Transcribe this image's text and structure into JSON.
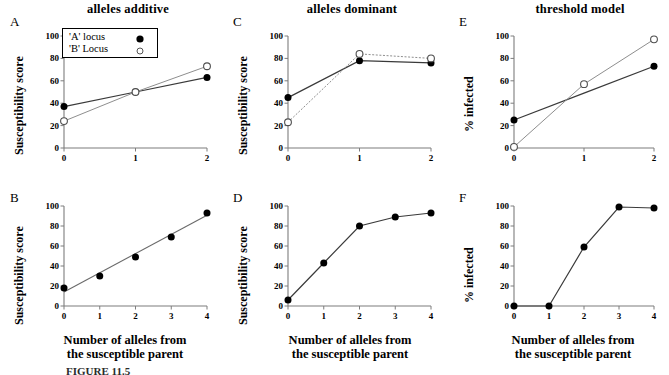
{
  "figure": {
    "column_titles": [
      "alleles additive",
      "alleles dominant",
      "threshold model"
    ],
    "caption_fragment": "FIGURE 11.5",
    "legend": {
      "items": [
        {
          "label": "'A' locus",
          "marker": "filled-circle-icon"
        },
        {
          "label": "'B' Locus",
          "marker": "open-circle-icon"
        }
      ]
    },
    "axis_titles": {
      "y_susceptibility": "Susceptibility score",
      "y_infected": "% infected",
      "x_line1": "Number of alleles from",
      "x_line2": "the susceptible parent"
    },
    "panel_labels": [
      "A",
      "B",
      "C",
      "D",
      "E",
      "F"
    ]
  },
  "chart_data": [
    {
      "panel": "A",
      "type": "line",
      "title": "alleles additive",
      "xlabel": "",
      "ylabel": "Susceptibility score",
      "x": [
        0,
        1,
        2
      ],
      "xticks": [
        "0",
        "1",
        "2"
      ],
      "yticks": [
        "0",
        "20",
        "40",
        "60",
        "80",
        "100"
      ],
      "xlim": [
        0,
        2
      ],
      "ylim": [
        0,
        100
      ],
      "grid": false,
      "legend_position": "top-left-inside",
      "series": [
        {
          "name": "'A' locus",
          "marker": "filled-circle",
          "values": [
            37,
            50,
            63
          ]
        },
        {
          "name": "'B' Locus",
          "marker": "open-circle",
          "values": [
            24,
            50,
            73
          ]
        }
      ]
    },
    {
      "panel": "B",
      "type": "scatter",
      "title": "",
      "xlabel": "Number of alleles from the susceptible parent",
      "ylabel": "Susceptibility score",
      "x": [
        0,
        1,
        2,
        3,
        4
      ],
      "xticks": [
        "0",
        "1",
        "2",
        "3",
        "4"
      ],
      "yticks": [
        "0",
        "20",
        "40",
        "60",
        "80",
        "100"
      ],
      "xlim": [
        0,
        4
      ],
      "ylim": [
        0,
        100
      ],
      "grid": false,
      "trendline": {
        "intercept": 14,
        "slope": 19.2
      },
      "series": [
        {
          "name": "combined",
          "marker": "filled-circle",
          "values": [
            18,
            30,
            49,
            69,
            93
          ]
        }
      ]
    },
    {
      "panel": "C",
      "type": "line",
      "title": "alleles dominant",
      "xlabel": "",
      "ylabel": "Susceptibility score",
      "x": [
        0,
        1,
        2
      ],
      "xticks": [
        "0",
        "1",
        "2"
      ],
      "yticks": [
        "0",
        "20",
        "40",
        "60",
        "80",
        "100"
      ],
      "xlim": [
        0,
        2
      ],
      "ylim": [
        0,
        100
      ],
      "grid": false,
      "series": [
        {
          "name": "'A' locus",
          "marker": "filled-circle",
          "values": [
            45,
            78,
            76
          ]
        },
        {
          "name": "'B' Locus",
          "marker": "open-circle",
          "values": [
            23,
            84,
            80
          ]
        }
      ]
    },
    {
      "panel": "D",
      "type": "line",
      "title": "",
      "xlabel": "Number of alleles from the susceptible parent",
      "ylabel": "Susceptibility score",
      "x": [
        0,
        1,
        2,
        3,
        4
      ],
      "xticks": [
        "0",
        "1",
        "2",
        "3",
        "4"
      ],
      "yticks": [
        "0",
        "20",
        "40",
        "60",
        "80",
        "100"
      ],
      "xlim": [
        0,
        4
      ],
      "ylim": [
        0,
        100
      ],
      "grid": false,
      "series": [
        {
          "name": "combined",
          "marker": "filled-circle",
          "values": [
            6,
            43,
            80,
            89,
            93
          ]
        }
      ]
    },
    {
      "panel": "E",
      "type": "line",
      "title": "threshold model",
      "xlabel": "",
      "ylabel": "% infected",
      "x": [
        0,
        1,
        2
      ],
      "xticks": [
        "0",
        "1",
        "2"
      ],
      "yticks": [
        "0",
        "20",
        "40",
        "60",
        "80",
        "100"
      ],
      "xlim": [
        0,
        2
      ],
      "ylim": [
        0,
        100
      ],
      "grid": false,
      "series": [
        {
          "name": "'A' locus",
          "marker": "filled-circle",
          "values": [
            25,
            49,
            73
          ],
          "markers_shown": [
            true,
            false,
            true
          ]
        },
        {
          "name": "'B' Locus",
          "marker": "open-circle",
          "values": [
            1,
            57,
            97
          ]
        }
      ]
    },
    {
      "panel": "F",
      "type": "line",
      "title": "",
      "xlabel": "Number of alleles from the susceptible parent",
      "ylabel": "% infected",
      "x": [
        0,
        1,
        2,
        3,
        4
      ],
      "xticks": [
        "0",
        "1",
        "2",
        "3",
        "4"
      ],
      "yticks": [
        "0",
        "20",
        "40",
        "60",
        "80",
        "100"
      ],
      "xlim": [
        0,
        4
      ],
      "ylim": [
        0,
        100
      ],
      "grid": false,
      "series": [
        {
          "name": "combined",
          "marker": "filled-circle",
          "values": [
            0,
            0,
            59,
            99,
            98
          ]
        }
      ]
    }
  ]
}
